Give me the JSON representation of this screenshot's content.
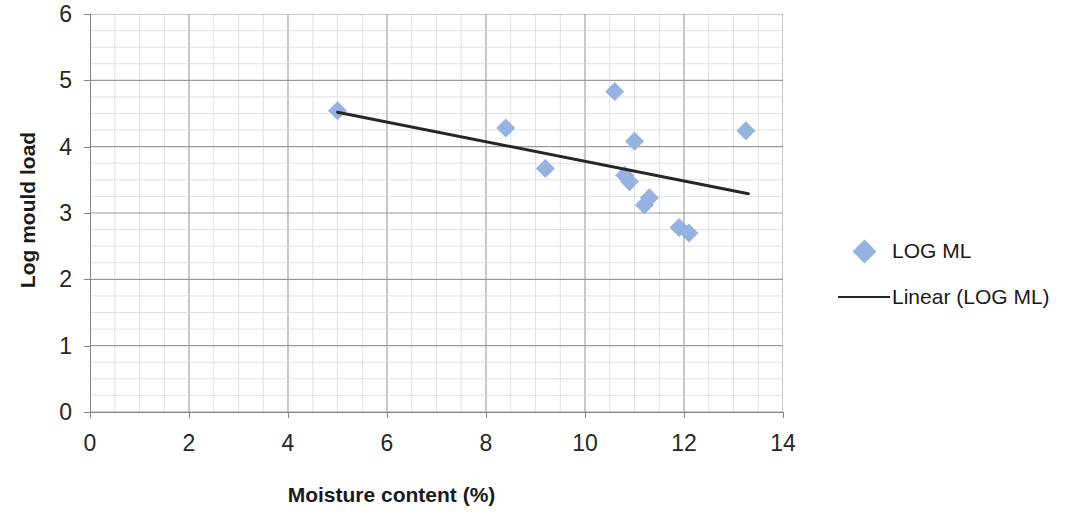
{
  "chart_data": {
    "type": "scatter",
    "title": "",
    "xlabel": "Moisture content (%)",
    "ylabel": "Log mould load",
    "xlim": [
      0,
      14
    ],
    "ylim": [
      0,
      6
    ],
    "xticks": [
      0,
      2,
      4,
      6,
      8,
      10,
      12,
      14
    ],
    "yticks": [
      0,
      1,
      2,
      3,
      4,
      5,
      6
    ],
    "x_major_step": 2,
    "y_major_step": 1,
    "x_minor_step": 0.5,
    "y_minor_step": 0.25,
    "grid": true,
    "legend_position": "right",
    "series": [
      {
        "name": "LOG ML",
        "type": "scatter",
        "marker": "diamond",
        "color": "#95B3E0",
        "points": [
          {
            "x": 5.0,
            "y": 4.54
          },
          {
            "x": 8.4,
            "y": 4.28
          },
          {
            "x": 9.2,
            "y": 3.67
          },
          {
            "x": 10.6,
            "y": 4.83
          },
          {
            "x": 10.8,
            "y": 3.57
          },
          {
            "x": 10.9,
            "y": 3.47
          },
          {
            "x": 11.0,
            "y": 4.08
          },
          {
            "x": 11.2,
            "y": 3.12
          },
          {
            "x": 11.3,
            "y": 3.23
          },
          {
            "x": 11.9,
            "y": 2.78
          },
          {
            "x": 12.1,
            "y": 2.7
          },
          {
            "x": 13.25,
            "y": 4.24
          }
        ]
      },
      {
        "name": "Linear (LOG ML)",
        "type": "line",
        "color": "#262626",
        "points": [
          {
            "x": 5.0,
            "y": 4.52
          },
          {
            "x": 13.3,
            "y": 3.29
          }
        ]
      }
    ]
  },
  "axes": {
    "x_title": "Moisture content (%)",
    "y_title": "Log mould load",
    "x_tick_labels": [
      "0",
      "2",
      "4",
      "6",
      "8",
      "10",
      "12",
      "14"
    ],
    "y_tick_labels": [
      "0",
      "1",
      "2",
      "3",
      "4",
      "5",
      "6"
    ]
  },
  "legend": {
    "items": [
      {
        "label": "LOG ML",
        "key": "diamond-marker",
        "color": "#95B3E0"
      },
      {
        "label": "Linear (LOG ML)",
        "key": "line-marker",
        "color": "#262626"
      }
    ]
  },
  "colors": {
    "marker": "#95B3E0",
    "trendline": "#262626",
    "grid_major": "#9a9a9a",
    "grid_minor": "#d8d8d8",
    "axis": "#868686",
    "text": "#1a1a1a"
  }
}
